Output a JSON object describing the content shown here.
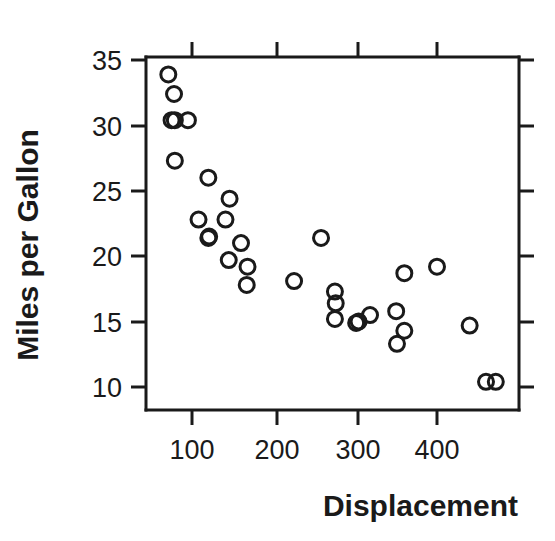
{
  "chart_data": {
    "type": "scatter",
    "title": "",
    "xlabel": "Displacement",
    "ylabel": "Miles per Gallon",
    "xlim": [
      55,
      510
    ],
    "ylim": [
      8.3,
      36.2
    ],
    "xticks": [
      100,
      200,
      300,
      400
    ],
    "yticks": [
      10,
      15,
      20,
      25,
      30,
      35
    ],
    "xtick_labels": [
      "100",
      "200",
      "300",
      "400"
    ],
    "ytick_labels": [
      "10",
      "15",
      "20",
      "25",
      "30",
      "35"
    ],
    "grid": false,
    "legend": false,
    "marker": "open-circle",
    "marker_color": "#1a1a1a",
    "points": [
      {
        "x": 71,
        "y": 33.9
      },
      {
        "x": 78,
        "y": 32.4
      },
      {
        "x": 75,
        "y": 30.4
      },
      {
        "x": 79,
        "y": 30.4
      },
      {
        "x": 95,
        "y": 30.4
      },
      {
        "x": 79,
        "y": 27.3
      },
      {
        "x": 120,
        "y": 26.0
      },
      {
        "x": 146,
        "y": 24.4
      },
      {
        "x": 108,
        "y": 22.8
      },
      {
        "x": 141,
        "y": 22.8
      },
      {
        "x": 121,
        "y": 21.5
      },
      {
        "x": 120,
        "y": 21.4
      },
      {
        "x": 160,
        "y": 21.0
      },
      {
        "x": 145,
        "y": 19.7
      },
      {
        "x": 168,
        "y": 19.2
      },
      {
        "x": 167,
        "y": 17.8
      },
      {
        "x": 225,
        "y": 18.1
      },
      {
        "x": 258,
        "y": 21.4
      },
      {
        "x": 275,
        "y": 17.3
      },
      {
        "x": 276,
        "y": 16.4
      },
      {
        "x": 275,
        "y": 15.2
      },
      {
        "x": 301,
        "y": 14.9
      },
      {
        "x": 304,
        "y": 15.0
      },
      {
        "x": 318,
        "y": 15.5
      },
      {
        "x": 350,
        "y": 15.8
      },
      {
        "x": 351,
        "y": 13.3
      },
      {
        "x": 360,
        "y": 14.3
      },
      {
        "x": 360,
        "y": 18.7
      },
      {
        "x": 400,
        "y": 19.2
      },
      {
        "x": 440,
        "y": 14.7
      },
      {
        "x": 460,
        "y": 10.4
      },
      {
        "x": 472,
        "y": 10.4
      }
    ],
    "n_points": 32
  },
  "axes": {
    "x_axis_name": "displacement-axis",
    "y_axis_name": "mpg-axis"
  }
}
